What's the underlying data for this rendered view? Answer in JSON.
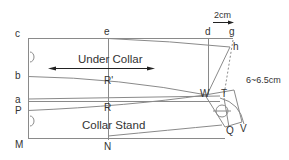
{
  "diagram": {
    "regions": {
      "under_collar": "Under Collar",
      "collar_stand": "Collar Stand"
    },
    "points": {
      "c": "c",
      "e": "e",
      "d": "d",
      "g": "g",
      "h": "h",
      "b": "b",
      "R_prime": "R'",
      "a": "a",
      "R": "R",
      "P": "P",
      "M": "M",
      "N": "N",
      "W": "W",
      "T": "T",
      "Q": "Q",
      "V": "V"
    },
    "measurements": {
      "shift": "2cm",
      "collar_height": "6~6.5cm"
    },
    "colors": {
      "line": "#8a8a8a",
      "text": "#333333"
    }
  }
}
